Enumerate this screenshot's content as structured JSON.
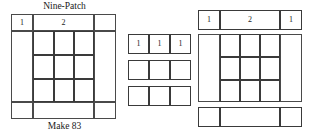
{
  "figure": {
    "title": "Nine-Patch",
    "caption": "Make 83"
  },
  "left_block": {
    "name": "nine-patch-block",
    "title": "Nine-Patch",
    "caption": "Make 83",
    "top_strip_labels": [
      "1",
      "2",
      ""
    ],
    "measurement_1": "1",
    "measurement_2": "2"
  },
  "middle_block": {
    "name": "pieced-strip-units",
    "rows": [
      {
        "labels": [
          "1",
          "1",
          "1"
        ]
      },
      {
        "labels": [
          "",
          "",
          ""
        ]
      },
      {
        "labels": [
          "",
          "",
          ""
        ]
      }
    ]
  },
  "right_block": {
    "name": "assembled-block",
    "top_strip_labels": [
      "1",
      "2",
      "1"
    ],
    "measurement_left": "1",
    "measurement_center": "2",
    "measurement_right": "1"
  },
  "colors": {
    "line": "#4a4a4a",
    "outer_line": "#555555",
    "text": "#1a1a1a",
    "background": "#ffffff"
  }
}
